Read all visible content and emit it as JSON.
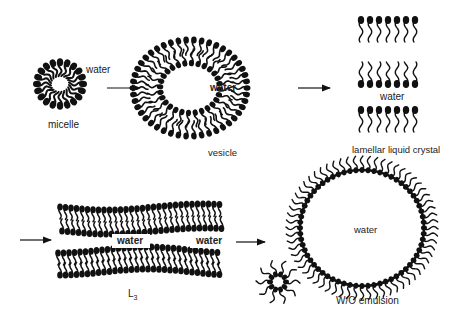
{
  "diagram": {
    "type": "phase-transition-sequence",
    "stages": [
      {
        "id": "micelle",
        "label": "micelle",
        "inner_label": "water"
      },
      {
        "id": "vesicle",
        "label": "vesicle",
        "inner_label": "water"
      },
      {
        "id": "lamellar",
        "label": "lamellar liquid crystal",
        "inner_label": "water"
      },
      {
        "id": "l3",
        "label": "L",
        "label_sub": "3",
        "inner_labels": [
          "water",
          "water"
        ]
      },
      {
        "id": "wo-emulsion",
        "label": "W/O emulsion",
        "inner_label": "water"
      }
    ],
    "arrows": [
      "micelle-to-vesicle",
      "vesicle-to-lamellar",
      "into-l3",
      "l3-to-wo-emulsion"
    ],
    "colors": {
      "ink": "#111111",
      "background": "#ffffff"
    }
  }
}
